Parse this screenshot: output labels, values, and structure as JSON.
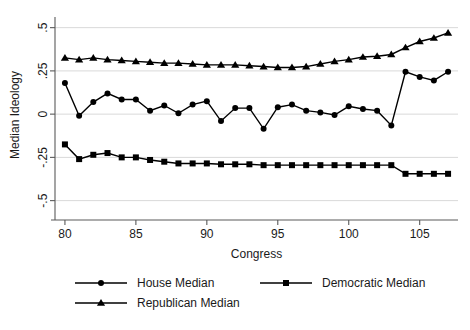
{
  "chart_data": {
    "type": "line",
    "title": "",
    "xlabel": "Congress",
    "ylabel": "Median Ideology",
    "xlim": [
      79.3,
      107.7
    ],
    "ylim": [
      -0.56,
      0.55
    ],
    "xticks": [
      80,
      85,
      90,
      95,
      100,
      105
    ],
    "xtick_labels": [
      "80",
      "85",
      "90",
      "95",
      "100",
      "105"
    ],
    "yticks": [
      0.5,
      0.25,
      0,
      -0.25,
      -0.5
    ],
    "ytick_labels": [
      ".5",
      ".25",
      "0",
      "-.25",
      "-.5"
    ],
    "grid": true,
    "grid_axis": "y",
    "legend_position": "bottom",
    "x": [
      80,
      81,
      82,
      83,
      84,
      85,
      86,
      87,
      88,
      89,
      90,
      91,
      92,
      93,
      94,
      95,
      96,
      97,
      98,
      99,
      100,
      101,
      102,
      103,
      104,
      105,
      106,
      107
    ],
    "series": [
      {
        "name": "House Median",
        "marker": "circle",
        "values": [
          0.18,
          -0.01,
          0.07,
          0.12,
          0.085,
          0.085,
          0.02,
          0.05,
          0.005,
          0.055,
          0.075,
          -0.04,
          0.035,
          0.035,
          -0.085,
          0.04,
          0.055,
          0.02,
          0.01,
          -0.005,
          0.045,
          0.03,
          0.02,
          -0.065,
          0.245,
          0.215,
          0.195,
          0.245
        ]
      },
      {
        "name": "Democratic Median",
        "marker": "square",
        "values": [
          -0.175,
          -0.26,
          -0.235,
          -0.225,
          -0.25,
          -0.25,
          -0.265,
          -0.275,
          -0.285,
          -0.285,
          -0.285,
          -0.29,
          -0.29,
          -0.29,
          -0.295,
          -0.295,
          -0.295,
          -0.295,
          -0.295,
          -0.295,
          -0.295,
          -0.295,
          -0.295,
          -0.295,
          -0.345,
          -0.345,
          -0.345,
          -0.345
        ]
      },
      {
        "name": "Republican Median",
        "marker": "triangle",
        "values": [
          0.325,
          0.315,
          0.325,
          0.315,
          0.31,
          0.305,
          0.3,
          0.295,
          0.295,
          0.29,
          0.285,
          0.285,
          0.285,
          0.28,
          0.275,
          0.27,
          0.27,
          0.275,
          0.29,
          0.305,
          0.315,
          0.33,
          0.335,
          0.345,
          0.385,
          0.42,
          0.44,
          0.47
        ]
      }
    ]
  },
  "legend": {
    "items": [
      {
        "label": "House Median",
        "marker": "circle"
      },
      {
        "label": "Democratic Median",
        "marker": "square"
      },
      {
        "label": "Republican Median",
        "marker": "triangle"
      }
    ]
  }
}
